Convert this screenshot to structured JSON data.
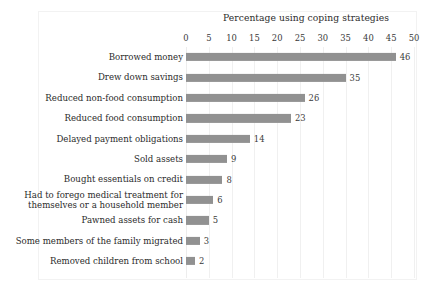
{
  "chart_data": {
    "type": "bar",
    "orientation": "horizontal",
    "title": "Percentage using coping strategies",
    "xlabel": "",
    "ylabel": "",
    "xlim": [
      0,
      50
    ],
    "xticks": [
      "0",
      "5",
      "10",
      "15",
      "20",
      "25",
      "30",
      "35",
      "40",
      "45",
      "50"
    ],
    "grid": "vertical",
    "legend": "none",
    "bar_color": "#919191",
    "text_color": "#2b2b2b",
    "categories": [
      "Borrowed money",
      "Drew down savings",
      "Reduced non-food consumption",
      "Reduced food consumption",
      "Delayed payment obligations",
      "Sold assets",
      "Bought essentials on credit",
      "Had to forego medical treatment for themselves or a household member",
      "Pawned assets for cash",
      "Some members of the family  migrated",
      "Removed children from school"
    ],
    "category_lines": [
      [
        "Borrowed money"
      ],
      [
        "Drew down savings"
      ],
      [
        "Reduced non-food consumption"
      ],
      [
        "Reduced food consumption"
      ],
      [
        "Delayed payment obligations"
      ],
      [
        "Sold assets"
      ],
      [
        "Bought essentials on credit"
      ],
      [
        "Had to forego medical treatment for",
        "themselves or a household member"
      ],
      [
        "Pawned assets for cash"
      ],
      [
        "Some members of the family  migrated"
      ],
      [
        "Removed children from school"
      ]
    ],
    "values": [
      46,
      35,
      26,
      23,
      14,
      9,
      8,
      6,
      5,
      3,
      2
    ],
    "value_labels": [
      "46",
      "35",
      "26",
      "23",
      "14",
      "9",
      "8",
      "6",
      "5",
      "3",
      "2"
    ]
  }
}
